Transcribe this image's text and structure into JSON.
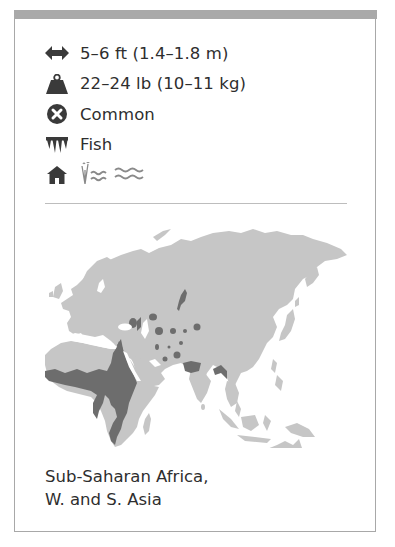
{
  "card": {
    "facts": [
      {
        "icon": "length-arrows-icon",
        "text": "5–6 ft (1.4–1.8 m)"
      },
      {
        "icon": "weight-icon",
        "text": "22–24 lb (10–11 kg)"
      },
      {
        "icon": "status-common-icon",
        "text": "Common"
      },
      {
        "icon": "diet-teeth-icon",
        "text": "Fish"
      }
    ],
    "habitat": {
      "icons": [
        "habitat-house-icon",
        "wetland-reeds-icon",
        "water-waves-icon"
      ]
    },
    "map": {
      "label": "Range map",
      "colors": {
        "land": "#c6c6c6",
        "range": "#6d6d6d"
      },
      "regions_highlighted": [
        "Sub-Saharan Africa",
        "Nile valley",
        "Western Asia",
        "Southern Asia"
      ]
    },
    "range": {
      "line1": "Sub-Saharan Africa,",
      "line2": "W. and S. Asia"
    }
  },
  "colors": {
    "border": "#a8a8a8",
    "topbar": "#a9a9a9",
    "text": "#2e2e2e",
    "icon": "#3a3a3a",
    "separator": "#bdbdbd"
  }
}
